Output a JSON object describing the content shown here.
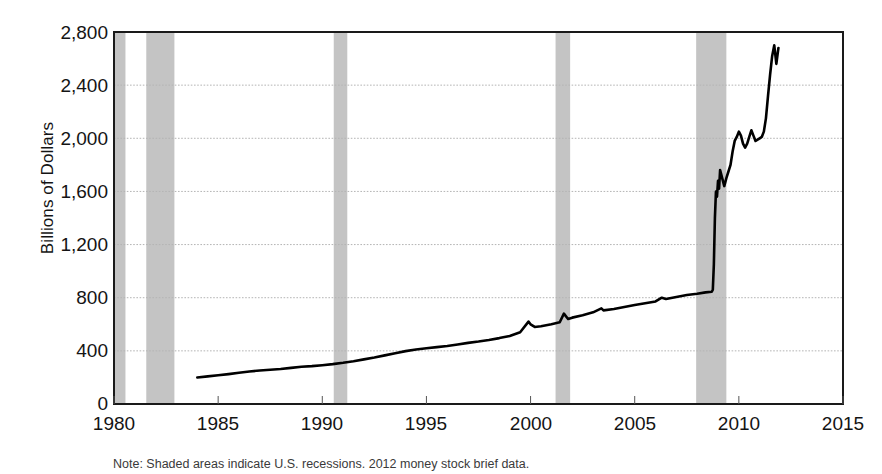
{
  "chart_data": {
    "type": "line",
    "title": "",
    "subtitle": "",
    "xlabel": "",
    "ylabel": "Billions of Dollars",
    "xlim": [
      1980,
      2015
    ],
    "ylim": [
      0,
      2800
    ],
    "grid": true,
    "legend": null,
    "x_ticks": [
      "1980",
      "1985",
      "1990",
      "1995",
      "2000",
      "2005",
      "2010",
      "2015"
    ],
    "x_tick_values": [
      1980,
      1985,
      1990,
      1995,
      2000,
      2005,
      2010,
      2015
    ],
    "y_ticks": [
      "0",
      "400",
      "800",
      "1,200",
      "1,600",
      "2,000",
      "2,400",
      "2,800"
    ],
    "y_tick_values": [
      0,
      400,
      800,
      1200,
      1600,
      2000,
      2400,
      2800
    ],
    "series": [
      {
        "name": "Monetary Base",
        "color": "#000000",
        "line_width": 2.6,
        "x": [
          1984.0,
          1984.5,
          1985.0,
          1985.5,
          1986.0,
          1986.5,
          1987.0,
          1987.5,
          1988.0,
          1988.5,
          1989.0,
          1989.5,
          1990.0,
          1990.5,
          1991.0,
          1991.5,
          1992.0,
          1992.5,
          1993.0,
          1993.5,
          1994.0,
          1994.5,
          1995.0,
          1995.5,
          1996.0,
          1996.5,
          1997.0,
          1997.5,
          1998.0,
          1998.5,
          1999.0,
          1999.5,
          1999.9,
          2000.0,
          2000.2,
          2000.5,
          2001.0,
          2001.4,
          2001.6,
          2001.8,
          2002.0,
          2002.5,
          2003.0,
          2003.4,
          2003.5,
          2004.0,
          2004.5,
          2005.0,
          2005.5,
          2006.0,
          2006.3,
          2006.5,
          2007.0,
          2007.5,
          2008.0,
          2008.4,
          2008.7,
          2008.75,
          2008.8,
          2008.85,
          2008.9,
          2008.95,
          2009.0,
          2009.05,
          2009.1,
          2009.2,
          2009.3,
          2009.4,
          2009.5,
          2009.6,
          2009.7,
          2009.8,
          2009.9,
          2010.0,
          2010.1,
          2010.2,
          2010.3,
          2010.4,
          2010.5,
          2010.6,
          2010.7,
          2010.8,
          2010.9,
          2011.0,
          2011.1,
          2011.2,
          2011.3,
          2011.4,
          2011.5,
          2011.6,
          2011.7,
          2011.8,
          2011.9
        ],
        "y": [
          200,
          208,
          216,
          225,
          235,
          245,
          252,
          258,
          264,
          272,
          280,
          285,
          292,
          300,
          310,
          322,
          336,
          350,
          366,
          382,
          398,
          410,
          420,
          428,
          436,
          448,
          460,
          470,
          482,
          496,
          512,
          540,
          620,
          600,
          580,
          585,
          600,
          615,
          680,
          640,
          650,
          668,
          690,
          720,
          705,
          715,
          730,
          745,
          758,
          772,
          800,
          790,
          805,
          820,
          830,
          840,
          845,
          860,
          1050,
          1400,
          1600,
          1560,
          1680,
          1620,
          1760,
          1700,
          1640,
          1700,
          1750,
          1800,
          1900,
          1980,
          2010,
          2050,
          2020,
          1960,
          1930,
          1960,
          2010,
          2060,
          2020,
          1980,
          1990,
          2000,
          2010,
          2050,
          2150,
          2320,
          2480,
          2620,
          2700,
          2560,
          2680
        ]
      }
    ],
    "recession_bands": [
      {
        "label": "1980 recession",
        "start": 1980.0,
        "end": 1980.55,
        "color": "#c4c4c4"
      },
      {
        "label": "1981-82 recession",
        "start": 1981.55,
        "end": 1982.9,
        "color": "#c4c4c4"
      },
      {
        "label": "1990-91 recession",
        "start": 1990.55,
        "end": 1991.2,
        "color": "#c4c4c4"
      },
      {
        "label": "2001 recession",
        "start": 2001.2,
        "end": 2001.9,
        "color": "#c4c4c4"
      },
      {
        "label": "2007-09 recession",
        "start": 2007.95,
        "end": 2009.4,
        "color": "#c4c4c4"
      }
    ],
    "colors": {
      "line": "#000000",
      "recession_band": "#c4c4c4",
      "gridline": "#b4b4b4",
      "axis": "#1a1a1a",
      "background": "#ffffff"
    },
    "annotations": []
  },
  "caption": {
    "text": "Note: Shaded areas indicate U.S. recessions. 2012 money stock brief data."
  }
}
